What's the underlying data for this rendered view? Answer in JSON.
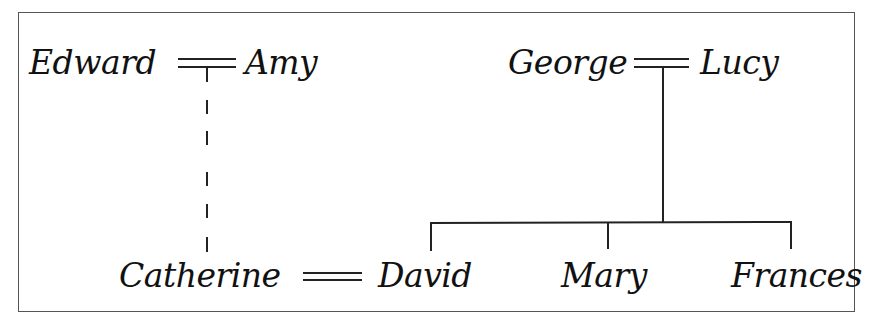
{
  "diagram": {
    "type": "family-tree",
    "people": {
      "edward": "Edward",
      "amy": "Amy",
      "george": "George",
      "lucy": "Lucy",
      "catherine": "Catherine",
      "david": "David",
      "mary": "Mary",
      "frances": "Frances"
    },
    "marriages": [
      {
        "partners": [
          "Edward",
          "Amy"
        ]
      },
      {
        "partners": [
          "George",
          "Lucy"
        ]
      },
      {
        "partners": [
          "Catherine",
          "David"
        ]
      }
    ],
    "descent": [
      {
        "parents": [
          "Edward",
          "Amy"
        ],
        "children": [
          "Catherine"
        ],
        "line_style": "dashed"
      },
      {
        "parents": [
          "George",
          "Lucy"
        ],
        "children": [
          "David",
          "Mary",
          "Frances"
        ],
        "line_style": "solid"
      }
    ]
  }
}
